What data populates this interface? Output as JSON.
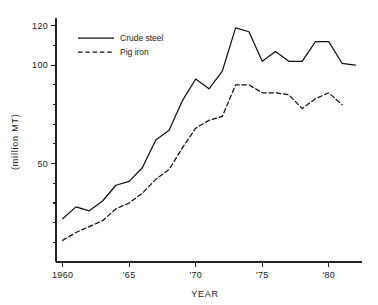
{
  "chart_data": {
    "type": "line",
    "title": "",
    "xlabel": "YEAR",
    "ylabel": "(million MT)",
    "xlim": [
      1959.5,
      1982.5
    ],
    "ylim": [
      0,
      124
    ],
    "grid": false,
    "legend_position": "top-left",
    "x": [
      1960,
      1961,
      1962,
      1963,
      1964,
      1965,
      1966,
      1967,
      1968,
      1969,
      1970,
      1971,
      1972,
      1973,
      1974,
      1975,
      1976,
      1977,
      1978,
      1979,
      1980,
      1981,
      1982
    ],
    "y_ticks_major": [
      50,
      100,
      120
    ],
    "y_tick_labels_major": [
      "50",
      "100",
      "120"
    ],
    "y_ticks_minor": [
      10,
      20,
      30,
      40,
      60,
      70,
      80,
      90,
      110
    ],
    "x_ticks": [
      1960,
      1965,
      1970,
      1975,
      1980
    ],
    "x_tick_labels": [
      "1960",
      "'65",
      "'70",
      "'75",
      "'80"
    ],
    "series": [
      {
        "name": "Crude steel",
        "style": "solid",
        "color": "#111111",
        "values": [
          22,
          28,
          26,
          31,
          39,
          41,
          48,
          62,
          67,
          82,
          93,
          88,
          97,
          119,
          117,
          102,
          107,
          102,
          102,
          112,
          112,
          101,
          100
        ]
      },
      {
        "name": "Pig iron",
        "style": "dashed",
        "color": "#111111",
        "values": [
          11,
          15,
          18,
          21,
          27,
          30,
          35,
          42,
          47,
          58,
          68,
          72,
          74,
          90,
          90,
          86,
          86,
          85,
          78,
          83,
          86,
          80,
          null
        ]
      }
    ],
    "legend": [
      {
        "label": "Crude steel",
        "style": "solid"
      },
      {
        "label": "Pig iron",
        "style": "dashed"
      }
    ]
  }
}
